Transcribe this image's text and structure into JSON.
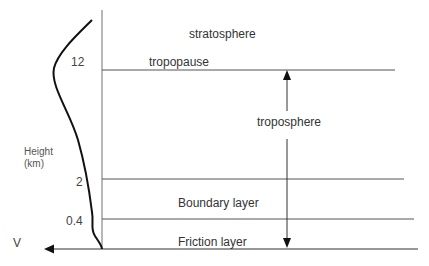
{
  "diagram": {
    "axis": {
      "y_label_line1": "Height",
      "y_label_line2": "(km)",
      "x_label": "V"
    },
    "height_ticks": [
      {
        "value": "12",
        "label": "12"
      },
      {
        "value": "2",
        "label": "2"
      },
      {
        "value": "0.4",
        "label": "0.4"
      }
    ],
    "layers": {
      "stratosphere": "stratosphere",
      "tropopause": "tropopause",
      "troposphere": "troposphere",
      "boundary": "Boundary layer",
      "friction": "Friction layer"
    },
    "colors": {
      "line": "#555555",
      "curve": "#111111",
      "text": "#333333",
      "background": "#ffffff"
    }
  }
}
